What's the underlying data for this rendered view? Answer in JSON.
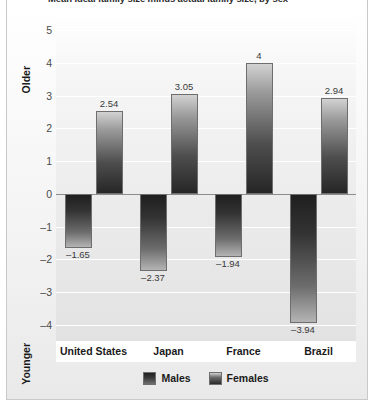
{
  "figure": {
    "title_clipped": "Mean ideal family size minus actual family size, by sex"
  },
  "legend": {
    "position": "bottom-center",
    "items": [
      {
        "label": "Males",
        "name": "legend-swatch-males",
        "color": "#333333"
      },
      {
        "label": "Females",
        "name": "legend-swatch-females",
        "color": "#6a6a6a"
      }
    ]
  },
  "axes": {
    "y_top_label": "Older",
    "y_bottom_label": "Younger",
    "y_ticks": [
      "5",
      "4",
      "3",
      "2",
      "1",
      "0",
      "-1",
      "-2",
      "-3",
      "-4"
    ],
    "y_tick_display": [
      "5",
      "4",
      "3",
      "2",
      "1",
      "0",
      "–1",
      "–2",
      "–3",
      "–4"
    ],
    "ylim": [
      -4.5,
      5.5
    ],
    "grid": true
  },
  "chart_data": {
    "type": "bar",
    "title": "Mean ideal family size minus actual family size, by sex",
    "xlabel": "",
    "ylabel": "",
    "ylim": [
      -4.5,
      5.5
    ],
    "grid": true,
    "legend_position": "bottom-center",
    "categories": [
      "United States",
      "Japan",
      "France",
      "Brazil"
    ],
    "series": [
      {
        "name": "Males",
        "values": [
          -1.65,
          -2.37,
          -1.94,
          -3.94
        ],
        "color": "#333333"
      },
      {
        "name": "Females",
        "values": [
          2.54,
          3.05,
          4,
          2.94
        ],
        "color": "#6a6a6a"
      }
    ],
    "data_labels": {
      "Males": [
        "–1.65",
        "–2.37",
        "–1.94",
        "–3.94"
      ],
      "Females": [
        "2.54",
        "3.05",
        "4",
        "2.94"
      ]
    }
  }
}
